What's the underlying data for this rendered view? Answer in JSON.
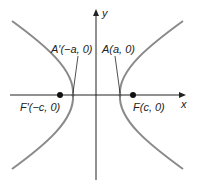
{
  "diagram": {
    "axes": {
      "x_label": "x",
      "y_label": "y"
    },
    "labels": {
      "vertex_left": "A′(−a, 0)",
      "vertex_right": "A(a, 0)",
      "focus_left": "F′(−c, 0)",
      "focus_right": "F(c, 0)"
    },
    "colors": {
      "curve": "#8a8a8a",
      "axis": "#222222",
      "point": "#111111"
    }
  }
}
